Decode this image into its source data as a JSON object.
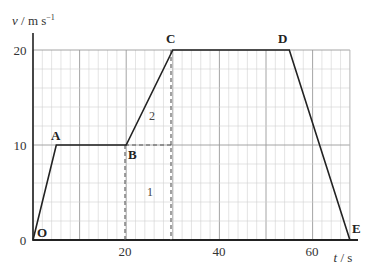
{
  "chart_data": {
    "type": "line",
    "title": "",
    "xlabel": "t / s",
    "ylabel": "v / m s⁻¹",
    "xlim": [
      0,
      68
    ],
    "ylim": [
      0,
      20
    ],
    "grid": true,
    "x_ticks": [
      0,
      20,
      40,
      60
    ],
    "y_ticks": [
      0,
      10,
      20
    ],
    "x_tick_labels": [
      "20",
      "40",
      "60"
    ],
    "y_tick_labels": [
      "0",
      "10",
      "20"
    ],
    "series": [
      {
        "name": "velocity",
        "points": [
          {
            "label": "O",
            "t": 0,
            "v": 0
          },
          {
            "label": "A",
            "t": 5,
            "v": 10
          },
          {
            "label": "B",
            "t": 20,
            "v": 10
          },
          {
            "label": "C",
            "t": 30,
            "v": 20
          },
          {
            "label": "D",
            "t": 55,
            "v": 20
          },
          {
            "label": "E",
            "t": 68,
            "v": 0
          }
        ]
      }
    ],
    "annotations": [
      {
        "text": "1",
        "description": "rectangle area under B-C segment",
        "t": 25,
        "v": 4
      },
      {
        "text": "2",
        "description": "triangle area under B-C segment",
        "t": 26,
        "v": 14
      }
    ],
    "dashed_lines": [
      {
        "from": {
          "t": 20,
          "v": 10
        },
        "to": {
          "t": 20,
          "v": 0
        }
      },
      {
        "from": {
          "t": 30,
          "v": 20
        },
        "to": {
          "t": 30,
          "v": 0
        }
      },
      {
        "from": {
          "t": 20,
          "v": 10
        },
        "to": {
          "t": 30,
          "v": 10
        }
      }
    ]
  },
  "labels": {
    "y_axis": "v / m s",
    "y_axis_sup": "−1",
    "x_axis": "t / s",
    "y0": "0",
    "y10": "10",
    "y20": "20",
    "x20": "20",
    "x40": "40",
    "x60": "60",
    "O": "O",
    "A": "A",
    "B": "B",
    "C": "C",
    "D": "D",
    "E": "E",
    "region1": "1",
    "region2": "2"
  }
}
